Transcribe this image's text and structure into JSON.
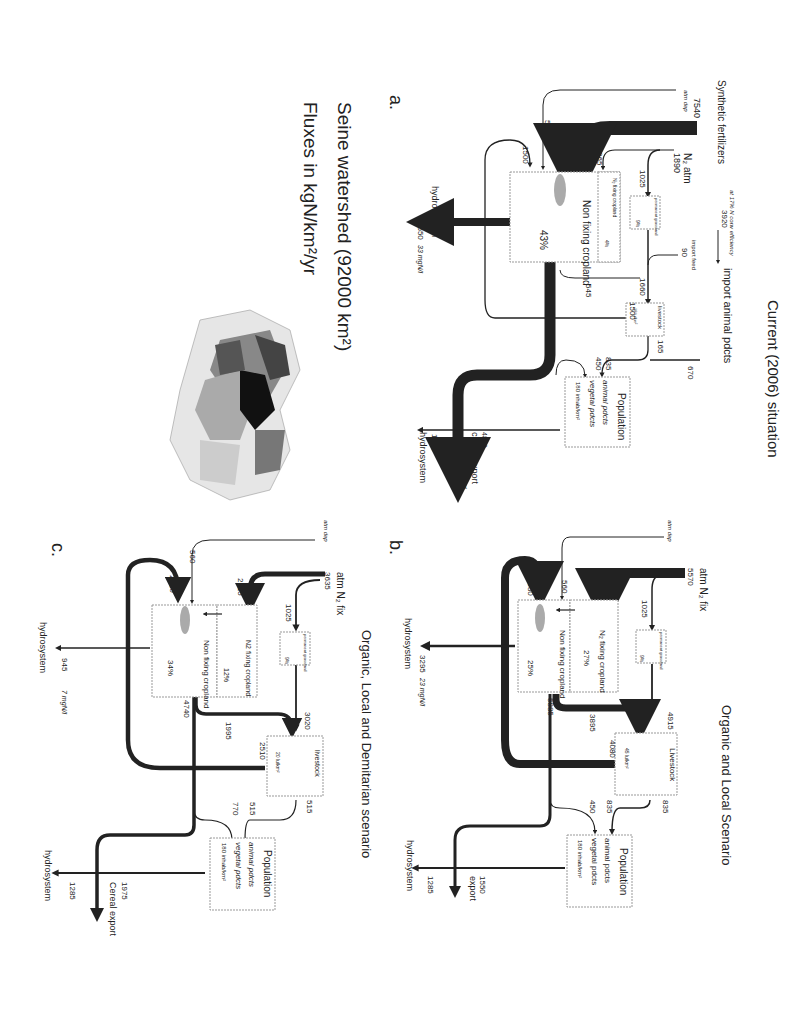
{
  "figure": {
    "orientation": "rotated 90 degrees clockwise",
    "watershed_title": "Seine watershed (92000 km²)",
    "units_title": "Fluxes in kgN/km²/yr",
    "map": {
      "name": "Seine watershed map",
      "shades": [
        "#111111",
        "#444444",
        "#777777",
        "#aaaaaa",
        "#cccccc",
        "#e6e6e6"
      ]
    }
  },
  "panels": {
    "a": {
      "letter": "a.",
      "title": "Current (2006) situation",
      "inputs": {
        "synthetic_fertilizers_label": "Synthetic fertilizers",
        "synthetic_fertilizers": "7540",
        "atm_dep_label": "atm dep",
        "atm_dep": "560",
        "n2_atm_label": "N₂ atm",
        "n2_atm": "1890",
        "import_feed_label": "import feed",
        "import_feed": "90"
      },
      "flows": {
        "fert_to_cropland": "7540",
        "fix_to_cropland": "865",
        "fix_to_grassland": "1025",
        "manure_to_cropland": "1500",
        "grassland_to_livestock": "1660",
        "cropland_to_livestock": "545",
        "livestock_manure": "1500",
        "livestock_to_pop": "165",
        "pop_animal": "835",
        "pop_vegetal": "450",
        "import_animal": "670",
        "cropland_out": "5815"
      },
      "import_note": "at 17% N conv efficiency",
      "import_value": "3920",
      "import_label": "import animal pdcts",
      "boxes": {
        "fixing_cropland": "N₂ fixing cropland",
        "fixing_pct": "4%",
        "grassland": "permanent grassland",
        "grassland_pct": "9%",
        "cropland": "Non fixing cropland",
        "cropland_pct": "43%",
        "livestock": "livestock",
        "livestock_density": "18 lu/km²",
        "population": "Population",
        "animal_pdcts": "animal pdcts",
        "vegetal_pdcts": "vegetal pdcts",
        "inhab": "180 inhab/km²"
      },
      "outputs": {
        "hydro_label": "hydrosystem",
        "cropland_hydro": "4650",
        "cropland_conc": "33 mgN/l",
        "pop_hydro": "1285",
        "export": "4820",
        "export_label": "cereal export",
        "net_export": "810 net export"
      }
    },
    "b": {
      "letter": "b.",
      "title": "Organic and Local Scenario",
      "inputs": {
        "atm_dep_label": "atm dep",
        "atm_dep": "560",
        "fix_label": "atm N₂ fix",
        "fix": "5570"
      },
      "flows": {
        "fix_to_fixing": "4545",
        "fix_to_grassland": "1025",
        "manure_to_cropland": "4080",
        "cropland_out": "5885",
        "cropland_to_livestock": "3895",
        "grassland_to_livestock": "4915",
        "livestock_manure": "4080",
        "livestock_to_pop": "835",
        "pop_animal": "835",
        "pop_vegetal": "450"
      },
      "boxes": {
        "fixing_cropland": "N₂ fixing cropland",
        "fixing_pct": "27%",
        "grassland": "permanent grassland",
        "grassland_pct": "9%",
        "cropland": "Non fixing cropland",
        "cropland_pct": "25%",
        "livestock": "Livestock",
        "livestock_density": "45 lu/km²",
        "population": "Population",
        "animal_pdcts": "animal pdcts",
        "vegetal_pdcts": "vegetal pdcts",
        "inhab": "180 inhab/km²"
      },
      "outputs": {
        "hydro_label": "hydrosystem",
        "cropland_hydro": "3295",
        "cropland_conc": "23 mgN/l",
        "pop_hydro": "1285",
        "export": "1550",
        "export_label": "export"
      }
    },
    "c": {
      "letter": "c.",
      "title": "Organic, Local and Demitarian scenario",
      "inputs": {
        "atm_dep_label": "atm dep",
        "atm_dep": "560",
        "fix_label": "atm N₂ fix",
        "fix": "3635"
      },
      "flows": {
        "fix_to_fixing": "2615",
        "fix_to_grassland": "1025",
        "manure_to_cropland": "2510",
        "cropland_out": "4740",
        "cropland_to_livestock": "1995",
        "grassland_to_livestock": "3020",
        "livestock_manure": "2510",
        "livestock_to_pop": "515",
        "pop_animal": "515",
        "pop_vegetal": "770"
      },
      "boxes": {
        "fixing_cropland": "N2 fixing cropland",
        "fixing_pct": "12%",
        "grassland": "permanent grassland",
        "grassland_pct": "9%",
        "cropland": "Non fixing cropland",
        "cropland_pct": "34%",
        "livestock": "livestock",
        "livestock_density": "20 lu/km²",
        "population": "Population",
        "animal_pdcts": "animal pdcts",
        "vegetal_pdcts": "vegetal pdcts",
        "inhab": "180 inhab/km²"
      },
      "outputs": {
        "hydro_label": "hydrosystem",
        "cropland_hydro": "945",
        "cropland_conc": "7 mgN/l",
        "pop_hydro": "1285",
        "export": "1975",
        "export_label": "Cereal export"
      }
    }
  }
}
